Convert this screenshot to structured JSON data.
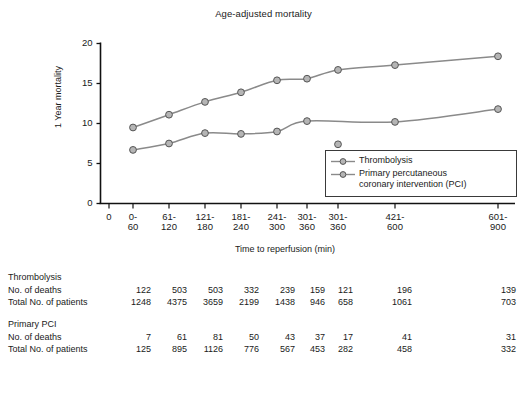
{
  "chart_data": {
    "type": "line",
    "title": "Age-adjusted mortality",
    "xlabel": "Time to reperfusion (min)",
    "ylabel": "1 Year mortality",
    "ylim": [
      0,
      20
    ],
    "yticks": [
      "0",
      "5",
      "10",
      "15",
      "20"
    ],
    "ytick_values": [
      0,
      5,
      10,
      15,
      20
    ],
    "grid": false,
    "legend_position": "bottom-right",
    "categories": [
      "0-\n60",
      "61-\n120",
      "121-\n180",
      "181-\n240",
      "241-\n300",
      "301-\n360",
      "301-\n360",
      "421-\n600",
      "601-\n900"
    ],
    "xtick_origin_label": "0",
    "series": [
      {
        "name": "Thrombolysis",
        "values": [
          9.5,
          11.1,
          12.7,
          13.9,
          15.4,
          15.6,
          16.7,
          17.3,
          18.4
        ],
        "color": "#8a8a8a"
      },
      {
        "name": "Primary percutaneous coronary intervention (PCI)",
        "values": [
          6.7,
          7.5,
          8.8,
          8.7,
          9.0,
          10.3,
          7.4,
          10.2,
          11.8
        ],
        "color": "#8a8a8a"
      }
    ]
  },
  "legend": {
    "items": [
      {
        "label": "Thrombolysis"
      },
      {
        "label_line1": "Primary percutaneous",
        "label_line2": "coronary intervention (PCI)"
      }
    ]
  },
  "table": {
    "groups": [
      {
        "title": "Thrombolysis",
        "rows": [
          {
            "label": "No. of deaths",
            "values": [
              "122",
              "503",
              "503",
              "332",
              "239",
              "159",
              "121",
              "196",
              "139"
            ]
          },
          {
            "label": "Total No. of patients",
            "values": [
              "1248",
              "4375",
              "3659",
              "2199",
              "1438",
              "946",
              "658",
              "1061",
              "703"
            ]
          }
        ]
      },
      {
        "title": "Primary PCI",
        "rows": [
          {
            "label": "No. of deaths",
            "values": [
              "7",
              "61",
              "81",
              "50",
              "43",
              "37",
              "17",
              "41",
              "31"
            ]
          },
          {
            "label": "Total No. of patients",
            "values": [
              "125",
              "895",
              "1126",
              "776",
              "567",
              "453",
              "282",
              "458",
              "332"
            ]
          }
        ]
      }
    ]
  },
  "colors": {
    "line": "#8a8a8a",
    "marker_fill": "#b5b5b5",
    "marker_stroke": "#555555",
    "axis": "#111111",
    "text": "#1a1a1a"
  }
}
